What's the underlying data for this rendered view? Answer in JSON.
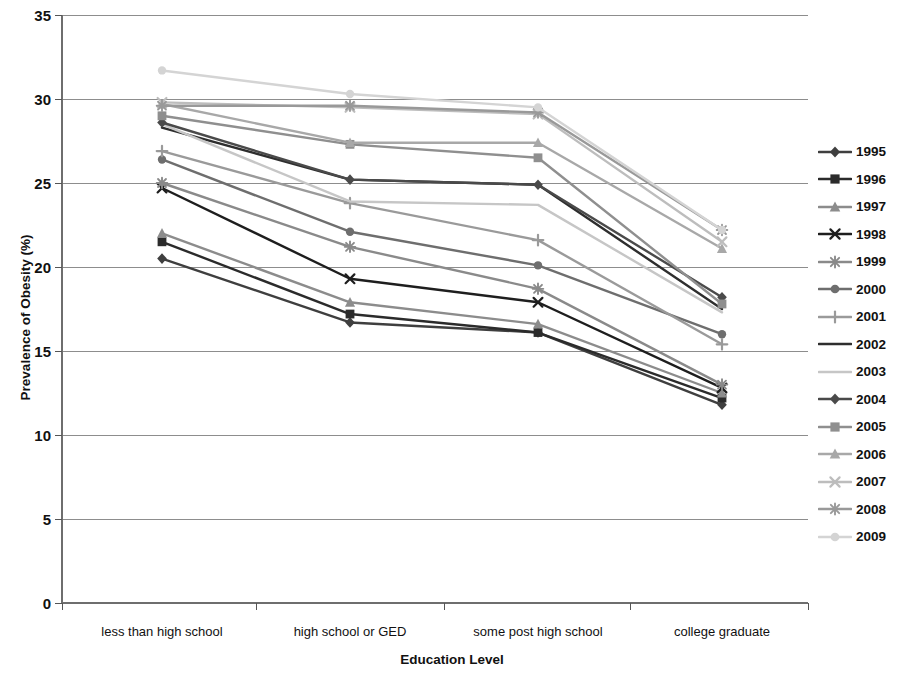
{
  "chart_data": {
    "type": "line",
    "title": "",
    "xlabel": "Education Level",
    "ylabel": "Prevalence of Obesity (%)",
    "categories": [
      "less than high school",
      "high school or GED",
      "some post high school",
      "college graduate"
    ],
    "ylim": [
      0,
      35
    ],
    "yticks": [
      0,
      5,
      10,
      15,
      20,
      25,
      30,
      35
    ],
    "ytick_labels": [
      "0",
      "5",
      "10",
      "15",
      "20",
      "25",
      "30",
      "35"
    ],
    "grid": "horizontal",
    "legend_position": "right",
    "series": [
      {
        "name": "1995",
        "marker": "diamond",
        "color": "#3f3f3f",
        "values": [
          20.5,
          16.7,
          16.1,
          11.8
        ]
      },
      {
        "name": "1996",
        "marker": "square",
        "color": "#2b2b2b",
        "values": [
          21.5,
          17.2,
          16.1,
          12.2
        ]
      },
      {
        "name": "1997",
        "marker": "triangle",
        "color": "#8c8c8c",
        "values": [
          22.0,
          17.9,
          16.6,
          12.5
        ]
      },
      {
        "name": "1998",
        "marker": "cross",
        "color": "#1e1e1e",
        "values": [
          24.7,
          19.3,
          17.9,
          12.8
        ]
      },
      {
        "name": "1999",
        "marker": "star",
        "color": "#8a8a8a",
        "values": [
          25.0,
          21.2,
          18.7,
          13.0
        ]
      },
      {
        "name": "2000",
        "marker": "circle",
        "color": "#6e6e6e",
        "values": [
          26.4,
          22.1,
          20.1,
          16.0
        ]
      },
      {
        "name": "2001",
        "marker": "plus",
        "color": "#9a9a9a",
        "values": [
          26.9,
          23.8,
          21.6,
          15.4
        ]
      },
      {
        "name": "2002",
        "marker": "none",
        "color": "#2e2e2e",
        "values": [
          28.3,
          25.2,
          24.9,
          17.5
        ]
      },
      {
        "name": "2003",
        "marker": "none",
        "color": "#c6c6c6",
        "values": [
          28.5,
          23.9,
          23.7,
          17.3
        ]
      },
      {
        "name": "2004",
        "marker": "diamond",
        "color": "#4a4a4a",
        "values": [
          28.6,
          25.2,
          24.9,
          18.2
        ]
      },
      {
        "name": "2005",
        "marker": "square",
        "color": "#8f8f8f",
        "values": [
          29.0,
          27.3,
          26.5,
          17.8
        ]
      },
      {
        "name": "2006",
        "marker": "triangle",
        "color": "#a8a8a8",
        "values": [
          29.7,
          27.4,
          27.4,
          21.1
        ]
      },
      {
        "name": "2007",
        "marker": "cross",
        "color": "#bdbdbd",
        "values": [
          29.8,
          29.5,
          29.1,
          21.5
        ]
      },
      {
        "name": "2008",
        "marker": "star",
        "color": "#999999",
        "values": [
          29.6,
          29.6,
          29.2,
          22.2
        ]
      },
      {
        "name": "2009",
        "marker": "circle",
        "color": "#d4d4d4",
        "values": [
          31.7,
          30.3,
          29.5,
          22.2
        ]
      }
    ]
  },
  "axis": {
    "ylabel": "Prevalence of Obesity (%)",
    "xlabel": "Education Level"
  }
}
